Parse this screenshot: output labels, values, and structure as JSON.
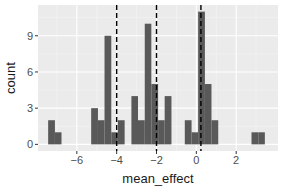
{
  "chart_data": {
    "type": "bar",
    "subtype": "histogram",
    "title": "",
    "xlabel": "mean_effect",
    "ylabel": "count",
    "xlim": [
      -7.95,
      4.1
    ],
    "ylim": [
      -0.55,
      11.55
    ],
    "x_ticks": [
      -6,
      -4,
      -2,
      0,
      2
    ],
    "x_tick_labels": [
      "-6",
      "-4",
      "-2",
      "0",
      "2"
    ],
    "y_ticks": [
      0,
      3,
      6,
      9
    ],
    "y_tick_labels": [
      "0",
      "3",
      "6",
      "9"
    ],
    "grid": true,
    "legend": null,
    "bin_width": 0.335,
    "bins": [
      {
        "x_start": -7.44,
        "x_end": -7.1,
        "count": 2
      },
      {
        "x_start": -7.1,
        "x_end": -6.77,
        "count": 1
      },
      {
        "x_start": -5.28,
        "x_end": -4.94,
        "count": 3
      },
      {
        "x_start": -4.94,
        "x_end": -4.61,
        "count": 2
      },
      {
        "x_start": -4.61,
        "x_end": -4.27,
        "count": 9
      },
      {
        "x_start": -4.27,
        "x_end": -3.94,
        "count": 1
      },
      {
        "x_start": -3.94,
        "x_end": -3.6,
        "count": 2
      },
      {
        "x_start": -3.26,
        "x_end": -2.93,
        "count": 4
      },
      {
        "x_start": -2.93,
        "x_end": -2.59,
        "count": 2
      },
      {
        "x_start": -2.59,
        "x_end": -2.26,
        "count": 10
      },
      {
        "x_start": -2.26,
        "x_end": -1.92,
        "count": 5
      },
      {
        "x_start": -1.92,
        "x_end": -1.59,
        "count": 2
      },
      {
        "x_start": -1.59,
        "x_end": -1.25,
        "count": 4
      },
      {
        "x_start": -0.58,
        "x_end": -0.24,
        "count": 2
      },
      {
        "x_start": -0.24,
        "x_end": 0.09,
        "count": 1
      },
      {
        "x_start": 0.09,
        "x_end": 0.43,
        "count": 11
      },
      {
        "x_start": 0.43,
        "x_end": 0.76,
        "count": 5
      },
      {
        "x_start": 0.76,
        "x_end": 1.1,
        "count": 2
      },
      {
        "x_start": 2.77,
        "x_end": 3.11,
        "count": 1
      },
      {
        "x_start": 3.11,
        "x_end": 3.44,
        "count": 1
      }
    ],
    "vlines": [
      {
        "x": -4.0,
        "style": "dashed",
        "color": "#000000"
      },
      {
        "x": -2.0,
        "style": "dashed",
        "color": "#000000"
      },
      {
        "x": 0.23,
        "style": "dashed",
        "color": "#000000"
      }
    ],
    "colors": {
      "bar_fill": "#595959",
      "panel_bg": "#ebebeb",
      "grid_major": "#ffffff",
      "grid_minor": "#f5f5f5",
      "tick_text": "#4d4d4d",
      "axis_title": "#1a1a1a"
    }
  }
}
